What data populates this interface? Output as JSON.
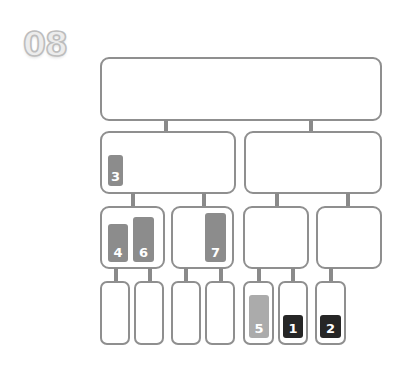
{
  "step_number": "08",
  "colors": {
    "border": "#8f8f8f",
    "connector": "#8a8a8a",
    "bar_mid": "#8c8c8c",
    "bar_light": "#ababab",
    "bar_dark": "#262626"
  },
  "tree": {
    "levels": 4,
    "level1": [
      {
        "id": "root"
      }
    ],
    "level2": [
      {
        "id": "L"
      },
      {
        "id": "R"
      }
    ],
    "level3": [
      {
        "id": "LL"
      },
      {
        "id": "LR"
      },
      {
        "id": "RL"
      },
      {
        "id": "RR"
      }
    ],
    "level4": [
      {
        "id": "LLL"
      },
      {
        "id": "LLR"
      },
      {
        "id": "LRL"
      },
      {
        "id": "LRR"
      },
      {
        "id": "RLL"
      },
      {
        "id": "RLR"
      },
      {
        "id": "RRL"
      }
    ]
  },
  "bars": [
    {
      "label": "3",
      "node": "L",
      "shade": "mid"
    },
    {
      "label": "4",
      "node": "LL",
      "shade": "mid"
    },
    {
      "label": "6",
      "node": "LL",
      "shade": "mid"
    },
    {
      "label": "7",
      "node": "LR",
      "shade": "mid"
    },
    {
      "label": "5",
      "node": "RLL",
      "shade": "light"
    },
    {
      "label": "1",
      "node": "RLR",
      "shade": "dark"
    },
    {
      "label": "2",
      "node": "RRL",
      "shade": "dark"
    }
  ]
}
